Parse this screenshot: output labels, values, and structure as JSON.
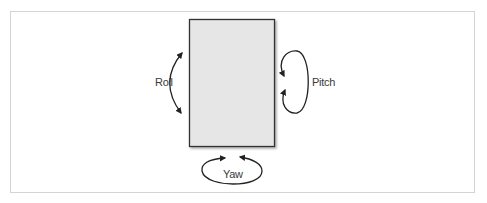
{
  "diagram": {
    "type": "rotation-axes",
    "body_fill": "#e6e6e6",
    "body_stroke": "#333333",
    "labels": {
      "roll": "Roll",
      "pitch": "Pitch",
      "yaw": "Yaw"
    }
  }
}
